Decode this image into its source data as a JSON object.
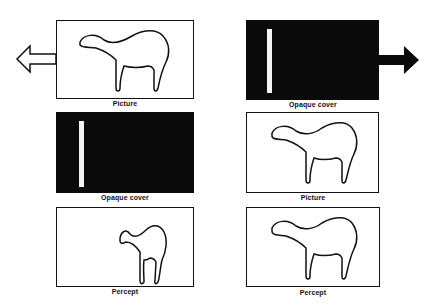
{
  "left_column": {
    "panels": [
      {
        "label": "Picture",
        "content": "camel outline"
      },
      {
        "label": "Opaque cover",
        "content": "slit"
      },
      {
        "label": "Percept",
        "content": "compressed camel outline"
      }
    ],
    "arrow_direction": "left"
  },
  "right_column": {
    "panels": [
      {
        "label": "Opaque cover",
        "content": "slit"
      },
      {
        "label": "Picture",
        "content": "camel outline"
      },
      {
        "label": "Percept",
        "content": "camel outline"
      }
    ],
    "arrow_direction": "right"
  },
  "colors": {
    "ink": "#111111",
    "cover": "#0a0a0a",
    "slit": "#f4f4f4",
    "background": "#ffffff"
  }
}
